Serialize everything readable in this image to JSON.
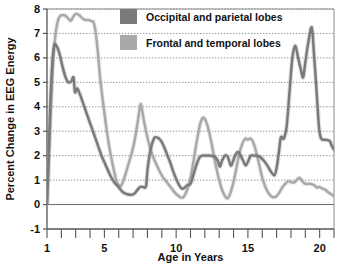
{
  "chart_data": {
    "type": "line",
    "title": "",
    "xlabel": "Age in Years",
    "ylabel": "Percent Change in EEG Energy",
    "xlim": [
      1,
      21
    ],
    "ylim": [
      -1,
      8
    ],
    "yticks": [
      -1,
      0,
      1,
      2,
      3,
      4,
      5,
      6,
      7,
      8
    ],
    "ytick_labels": [
      "-1",
      "0",
      "1",
      "2",
      "3",
      "4",
      "5",
      "6",
      "7",
      "8"
    ],
    "xticks": [
      1,
      5,
      10,
      15,
      20
    ],
    "xtick_labels": [
      "1",
      "5",
      "10",
      "15",
      "20"
    ],
    "x_minor_ticks": [
      1,
      2,
      3,
      4,
      5,
      6,
      7,
      8,
      9,
      10,
      11,
      12,
      13,
      14,
      15,
      16,
      17,
      18,
      19,
      20,
      21
    ],
    "grid": "horizontal-dotted",
    "legend_position": "top-center",
    "series": [
      {
        "name": "Occipital and parietal lobes",
        "color": "#7a7a7a",
        "points": [
          [
            1.0,
            0.05
          ],
          [
            1.1,
            1.6
          ],
          [
            1.2,
            3.6
          ],
          [
            1.35,
            5.6
          ],
          [
            1.5,
            6.5
          ],
          [
            1.7,
            6.45
          ],
          [
            1.9,
            6.1
          ],
          [
            2.1,
            5.6
          ],
          [
            2.3,
            5.2
          ],
          [
            2.5,
            5.0
          ],
          [
            2.7,
            5.05
          ],
          [
            2.85,
            5.2
          ],
          [
            2.95,
            4.6
          ],
          [
            3.1,
            4.75
          ],
          [
            3.3,
            4.5
          ],
          [
            3.6,
            4.0
          ],
          [
            3.9,
            3.5
          ],
          [
            4.2,
            3.0
          ],
          [
            4.5,
            2.5
          ],
          [
            4.8,
            2.0
          ],
          [
            5.1,
            1.6
          ],
          [
            5.4,
            1.2
          ],
          [
            5.7,
            0.9
          ],
          [
            6.0,
            0.7
          ],
          [
            6.3,
            0.5
          ],
          [
            6.6,
            0.42
          ],
          [
            6.9,
            0.4
          ],
          [
            7.1,
            0.45
          ],
          [
            7.3,
            0.6
          ],
          [
            7.5,
            0.72
          ],
          [
            7.7,
            0.72
          ],
          [
            7.9,
            0.75
          ],
          [
            8.0,
            1.4
          ],
          [
            8.2,
            2.2
          ],
          [
            8.45,
            2.7
          ],
          [
            8.6,
            2.75
          ],
          [
            8.8,
            2.7
          ],
          [
            9.0,
            2.55
          ],
          [
            9.2,
            2.3
          ],
          [
            9.4,
            2.0
          ],
          [
            9.6,
            1.7
          ],
          [
            9.8,
            1.35
          ],
          [
            10.0,
            1.05
          ],
          [
            10.2,
            0.8
          ],
          [
            10.4,
            0.65
          ],
          [
            10.6,
            0.7
          ],
          [
            10.8,
            0.8
          ],
          [
            11.0,
            0.85
          ],
          [
            11.2,
            1.2
          ],
          [
            11.4,
            1.6
          ],
          [
            11.6,
            1.9
          ],
          [
            11.8,
            2.0
          ],
          [
            12.1,
            2.0
          ],
          [
            12.4,
            2.0
          ],
          [
            12.7,
            1.95
          ],
          [
            12.9,
            1.8
          ],
          [
            13.05,
            1.55
          ],
          [
            13.2,
            1.8
          ],
          [
            13.4,
            2.0
          ],
          [
            13.6,
            1.95
          ],
          [
            13.8,
            1.6
          ],
          [
            13.95,
            1.75
          ],
          [
            14.1,
            2.0
          ],
          [
            14.3,
            2.15
          ],
          [
            14.5,
            2.0
          ],
          [
            14.7,
            1.75
          ],
          [
            14.85,
            1.6
          ],
          [
            15.0,
            1.75
          ],
          [
            15.2,
            2.0
          ],
          [
            15.4,
            2.0
          ],
          [
            15.6,
            2.0
          ],
          [
            15.85,
            1.95
          ],
          [
            16.1,
            1.8
          ],
          [
            16.35,
            1.6
          ],
          [
            16.6,
            1.35
          ],
          [
            16.85,
            1.2
          ],
          [
            17.0,
            1.5
          ],
          [
            17.15,
            2.1
          ],
          [
            17.3,
            2.75
          ],
          [
            17.5,
            2.7
          ],
          [
            17.7,
            3.2
          ],
          [
            17.9,
            4.6
          ],
          [
            18.1,
            6.0
          ],
          [
            18.3,
            6.5
          ],
          [
            18.5,
            6.0
          ],
          [
            18.7,
            5.5
          ],
          [
            18.85,
            5.2
          ],
          [
            19.0,
            5.8
          ],
          [
            19.2,
            6.6
          ],
          [
            19.45,
            7.25
          ],
          [
            19.6,
            6.2
          ],
          [
            19.8,
            4.5
          ],
          [
            19.95,
            3.2
          ],
          [
            20.1,
            2.7
          ],
          [
            20.4,
            2.65
          ],
          [
            20.7,
            2.6
          ],
          [
            20.85,
            2.4
          ],
          [
            21.0,
            2.25
          ]
        ]
      },
      {
        "name": "Frontal and temporal lobes",
        "color": "#a9a9a9",
        "points": [
          [
            1.0,
            0.05
          ],
          [
            1.15,
            2.2
          ],
          [
            1.3,
            4.3
          ],
          [
            1.45,
            6.1
          ],
          [
            1.6,
            7.0
          ],
          [
            1.75,
            7.5
          ],
          [
            1.9,
            7.7
          ],
          [
            2.1,
            7.75
          ],
          [
            2.3,
            7.72
          ],
          [
            2.5,
            7.6
          ],
          [
            2.65,
            7.52
          ],
          [
            2.8,
            7.65
          ],
          [
            2.95,
            7.78
          ],
          [
            3.1,
            7.8
          ],
          [
            3.3,
            7.72
          ],
          [
            3.5,
            7.6
          ],
          [
            3.7,
            7.55
          ],
          [
            3.9,
            7.55
          ],
          [
            4.1,
            7.5
          ],
          [
            4.25,
            7.45
          ],
          [
            4.4,
            7.0
          ],
          [
            4.55,
            6.2
          ],
          [
            4.7,
            5.2
          ],
          [
            4.9,
            4.2
          ],
          [
            5.1,
            3.3
          ],
          [
            5.3,
            2.5
          ],
          [
            5.5,
            1.85
          ],
          [
            5.7,
            1.3
          ],
          [
            5.85,
            0.95
          ],
          [
            6.0,
            0.8
          ],
          [
            6.15,
            0.75
          ],
          [
            6.3,
            0.95
          ],
          [
            6.5,
            1.3
          ],
          [
            6.7,
            1.7
          ],
          [
            6.9,
            2.1
          ],
          [
            7.1,
            2.6
          ],
          [
            7.3,
            3.3
          ],
          [
            7.45,
            3.9
          ],
          [
            7.55,
            4.1
          ],
          [
            7.7,
            3.6
          ],
          [
            7.9,
            3.0
          ],
          [
            8.1,
            2.5
          ],
          [
            8.3,
            2.1
          ],
          [
            8.5,
            1.8
          ],
          [
            8.7,
            1.55
          ],
          [
            8.9,
            1.3
          ],
          [
            9.1,
            1.1
          ],
          [
            9.3,
            0.95
          ],
          [
            9.5,
            0.8
          ],
          [
            9.7,
            0.65
          ],
          [
            9.9,
            0.5
          ],
          [
            10.1,
            0.38
          ],
          [
            10.3,
            0.3
          ],
          [
            10.5,
            0.3
          ],
          [
            10.7,
            0.5
          ],
          [
            10.9,
            0.85
          ],
          [
            11.1,
            1.4
          ],
          [
            11.3,
            2.1
          ],
          [
            11.5,
            2.8
          ],
          [
            11.7,
            3.35
          ],
          [
            11.85,
            3.55
          ],
          [
            12.0,
            3.5
          ],
          [
            12.2,
            3.2
          ],
          [
            12.4,
            2.7
          ],
          [
            12.6,
            2.1
          ],
          [
            12.8,
            1.5
          ],
          [
            13.0,
            1.0
          ],
          [
            13.2,
            0.6
          ],
          [
            13.4,
            0.35
          ],
          [
            13.55,
            0.25
          ],
          [
            13.7,
            0.35
          ],
          [
            13.9,
            0.7
          ],
          [
            14.1,
            1.2
          ],
          [
            14.3,
            1.8
          ],
          [
            14.5,
            2.3
          ],
          [
            14.7,
            2.6
          ],
          [
            14.85,
            2.7
          ],
          [
            15.0,
            2.65
          ],
          [
            15.2,
            2.7
          ],
          [
            15.4,
            2.5
          ],
          [
            15.6,
            2.1
          ],
          [
            15.8,
            1.6
          ],
          [
            16.0,
            1.1
          ],
          [
            16.2,
            0.75
          ],
          [
            16.4,
            0.5
          ],
          [
            16.6,
            0.35
          ],
          [
            16.8,
            0.3
          ],
          [
            17.0,
            0.35
          ],
          [
            17.2,
            0.5
          ],
          [
            17.4,
            0.7
          ],
          [
            17.6,
            0.85
          ],
          [
            17.8,
            0.95
          ],
          [
            18.0,
            0.92
          ],
          [
            18.2,
            0.9
          ],
          [
            18.4,
            1.0
          ],
          [
            18.6,
            1.1
          ],
          [
            18.8,
            0.95
          ],
          [
            19.0,
            0.85
          ],
          [
            19.3,
            0.85
          ],
          [
            19.6,
            0.8
          ],
          [
            19.8,
            0.7
          ],
          [
            20.0,
            0.72
          ],
          [
            20.2,
            0.65
          ],
          [
            20.4,
            0.6
          ],
          [
            20.6,
            0.5
          ],
          [
            20.8,
            0.42
          ],
          [
            21.0,
            0.35
          ]
        ]
      }
    ],
    "legend": [
      {
        "label": "Occipital and parietal lobes",
        "color": "#7a7a7a"
      },
      {
        "label": "Frontal and temporal lobes",
        "color": "#a9a9a9"
      }
    ]
  },
  "colors": {
    "axis": "#555555",
    "grid": "#8a8a8a",
    "text": "#111111",
    "background": "#ffffff"
  }
}
